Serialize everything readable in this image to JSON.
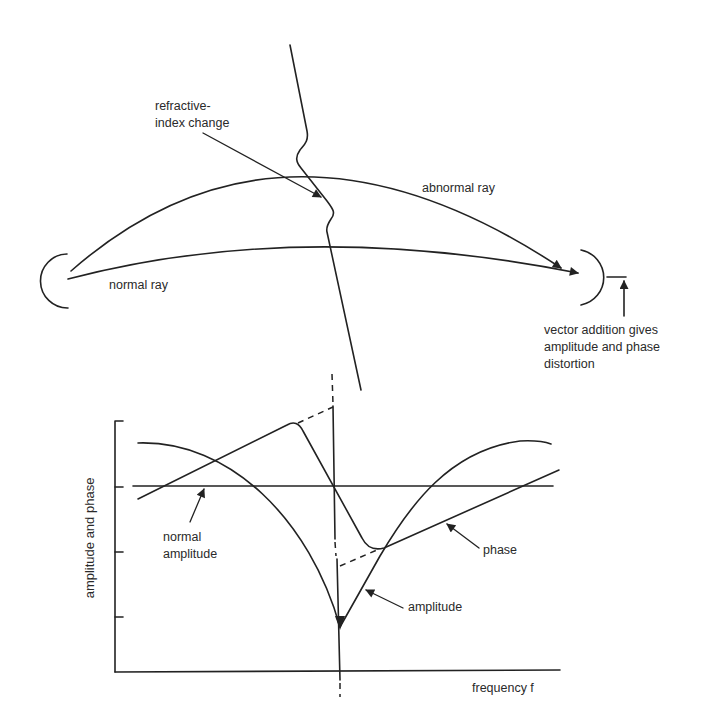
{
  "figure": {
    "ray_diagram": {
      "labels": {
        "refractive_line1": "refractive-",
        "refractive_line2": "index change",
        "abnormal_ray": "abnormal ray",
        "normal_ray": "normal ray",
        "vector_line1": "vector addition gives",
        "vector_line2": "amplitude and phase",
        "vector_line3": "distortion"
      },
      "elements": [
        "transmitter-antenna",
        "receiver-antenna",
        "normal-ray",
        "abnormal-ray",
        "refractive-index-boundary"
      ]
    },
    "plot": {
      "y_axis_label": "amplitude and phase",
      "x_axis_label": "frequency f",
      "annotations": {
        "normal_amplitude_line1": "normal",
        "normal_amplitude_line2": "amplitude",
        "phase": "phase",
        "amplitude": "amplitude"
      },
      "y_ticks": 4,
      "curves": [
        "amplitude",
        "phase",
        "normal amplitude"
      ]
    },
    "colors": {
      "ink": "#222222",
      "background": "#ffffff"
    }
  }
}
